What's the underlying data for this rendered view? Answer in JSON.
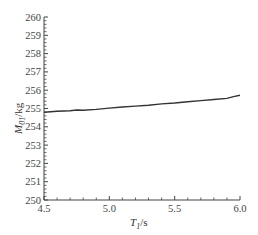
{
  "chart_data": {
    "type": "line",
    "title": "",
    "xlabel": "T1/s",
    "ylabel": "M01/kg",
    "xlim": [
      4.5,
      6.0
    ],
    "ylim": [
      250,
      260
    ],
    "x_ticks": [
      "4.5",
      "5.0",
      "5.5",
      "6.0"
    ],
    "y_ticks": [
      "250",
      "251",
      "252",
      "253",
      "254",
      "255",
      "256",
      "257",
      "258",
      "259",
      "260"
    ],
    "grid": false,
    "legend": null,
    "series": [
      {
        "name": "M01",
        "x": [
          4.5,
          4.6,
          4.7,
          4.75,
          4.8,
          4.9,
          5.0,
          5.1,
          5.2,
          5.3,
          5.4,
          5.5,
          5.6,
          5.7,
          5.8,
          5.9,
          5.95,
          6.0
        ],
        "values": [
          254.8,
          254.85,
          254.88,
          254.92,
          254.9,
          254.95,
          255.02,
          255.08,
          255.13,
          255.18,
          255.25,
          255.3,
          255.37,
          255.43,
          255.49,
          255.55,
          255.65,
          255.72
        ]
      }
    ]
  },
  "labels": {
    "x_axis_main": "T",
    "x_axis_sub": "1",
    "x_axis_unit": "/s",
    "y_axis_main": "M",
    "y_axis_sub": "01",
    "y_axis_unit": "/kg"
  },
  "colors": {
    "line": "#333333",
    "axis": "#444444"
  }
}
